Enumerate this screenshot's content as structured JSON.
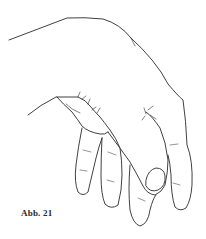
{
  "figure": {
    "caption": "Abb. 21",
    "stroke_color": "#2b2b2b",
    "background": "#ffffff"
  }
}
